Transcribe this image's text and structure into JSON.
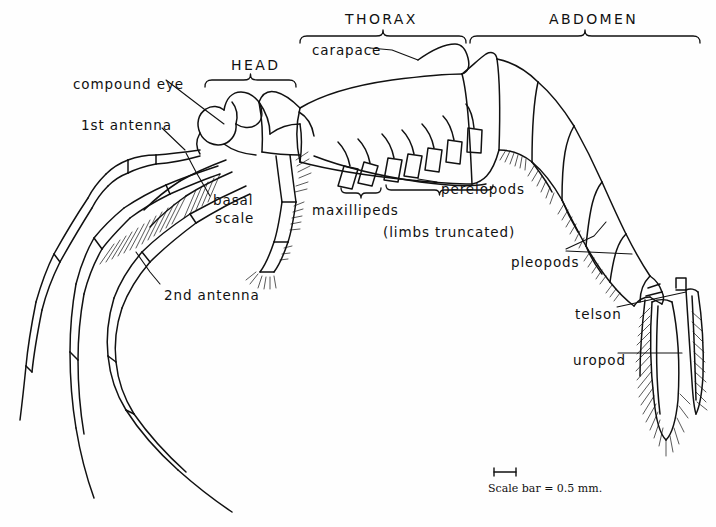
{
  "figure": {
    "ink_color": "#111111",
    "background_color": "#ffffff"
  },
  "region_brackets": [
    {
      "name": "head",
      "label": "HEAD",
      "x1": 205,
      "x2": 296,
      "y": 80,
      "label_x": 231,
      "label_y": 57
    },
    {
      "name": "thorax",
      "label": "THORAX",
      "x1": 300,
      "x2": 466,
      "y": 36,
      "label_x": 345,
      "label_y": 11
    },
    {
      "name": "abdomen",
      "label": "ABDOMEN",
      "x1": 470,
      "x2": 700,
      "y": 36,
      "label_x": 549,
      "label_y": 11
    }
  ],
  "limb_brackets": [
    {
      "name": "maxillipeds",
      "x1": 341,
      "x2": 381,
      "y": 193
    },
    {
      "name": "pereiopods",
      "x1": 386,
      "x2": 493,
      "y": 190
    }
  ],
  "labels": [
    {
      "name": "compound-eye",
      "text": "compound eye",
      "x": 73,
      "y": 76
    },
    {
      "name": "first-antenna",
      "text": "1st antenna",
      "x": 81,
      "y": 117
    },
    {
      "name": "basal-scale-line1",
      "text": "basal",
      "x": 213,
      "y": 192
    },
    {
      "name": "basal-scale-line2",
      "text": "scale",
      "x": 215,
      "y": 210
    },
    {
      "name": "second-antenna",
      "text": "2nd antenna",
      "x": 164,
      "y": 287
    },
    {
      "name": "carapace",
      "text": "carapace",
      "x": 312,
      "y": 42
    },
    {
      "name": "maxillipeds",
      "text": "maxillipeds",
      "x": 312,
      "y": 202
    },
    {
      "name": "pereiopods",
      "text": "pereiopods",
      "x": 441,
      "y": 181
    },
    {
      "name": "limbs-truncated",
      "text": "(limbs truncated)",
      "x": 383,
      "y": 224
    },
    {
      "name": "pleopods",
      "text": "pleopods",
      "x": 511,
      "y": 254
    },
    {
      "name": "telson",
      "text": "telson",
      "x": 575,
      "y": 306
    },
    {
      "name": "uropod",
      "text": "uropod",
      "x": 573,
      "y": 352
    }
  ],
  "leader_lines": [
    {
      "name": "compound-eye-leader",
      "points": "166,80 200,106 224,124"
    },
    {
      "name": "first-antenna-leader",
      "points": "162,128 185,150"
    },
    {
      "name": "basal-scale-leader",
      "points": "210,196 196,172 186,153"
    },
    {
      "name": "second-antenna-leader",
      "points": "160,284 150,272 136,252"
    },
    {
      "name": "carapace-leader",
      "points": "370,48 392,50 418,60"
    },
    {
      "name": "pereiopods-leader",
      "points": "437,182 418,179"
    },
    {
      "name": "pleopods-leader-a",
      "points": "566,249 594,236 606,222"
    },
    {
      "name": "pleopods-leader-b",
      "points": "566,251 632,254"
    },
    {
      "name": "telson-leader",
      "points": "617,307 686,292"
    },
    {
      "name": "uropod-leader",
      "points": "618,353 682,353"
    }
  ],
  "scale_bar": {
    "name": "scale-bar",
    "caption": "Scale bar = 0.5 mm.",
    "bar_x1": 494,
    "bar_x2": 516,
    "bar_y": 472,
    "caption_x": 488,
    "caption_y": 482
  }
}
